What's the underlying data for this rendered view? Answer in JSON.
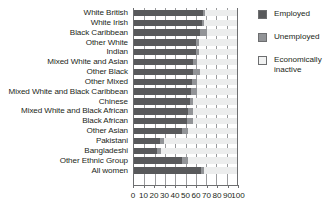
{
  "chart_data": {
    "type": "bar",
    "orientation": "horizontal",
    "stacked": true,
    "title": "",
    "xlabel": "",
    "ylabel": "",
    "xlim": [
      0,
      100
    ],
    "xticks": [
      "0",
      "10",
      "20",
      "30",
      "40",
      "50",
      "60",
      "70",
      "80",
      "90",
      "100"
    ],
    "grid": "vertical",
    "legend_position": "right",
    "categories": [
      "White British",
      "White Irish",
      "Black Caribbean",
      "Other White",
      "Indian",
      "Mixed White and Asian",
      "Other Black",
      "Other Mixed",
      "Mixed White and Black Caribbean",
      "Chinese",
      "Mixed White and Black African",
      "Black African",
      "Other Asian",
      "Pakistani",
      "Bangladeshi",
      "Other Ethnic Group",
      "All women"
    ],
    "series": [
      {
        "name": "Employed",
        "color": "#58595b",
        "values": [
          67,
          66,
          64,
          60,
          60,
          57,
          57,
          56,
          55,
          54,
          52,
          51,
          47,
          25,
          22,
          47,
          65
        ]
      },
      {
        "name": "Unemployed",
        "color": "#929497",
        "values": [
          2,
          2,
          7,
          3,
          3,
          4,
          7,
          5,
          6,
          3,
          5,
          6,
          5,
          4,
          4,
          5,
          3
        ]
      },
      {
        "name": "Economically inactive",
        "color": "#eceded",
        "values": [
          31,
          32,
          29,
          37,
          37,
          39,
          36,
          39,
          39,
          43,
          43,
          43,
          48,
          71,
          74,
          48,
          32
        ]
      }
    ]
  },
  "legend": {
    "items": [
      {
        "label": "Employed",
        "swatch": "sw-employed"
      },
      {
        "label": "Unemployed",
        "swatch": "sw-unemployed"
      },
      {
        "label": "Economically\ninactive",
        "swatch": "sw-inactive"
      }
    ]
  }
}
